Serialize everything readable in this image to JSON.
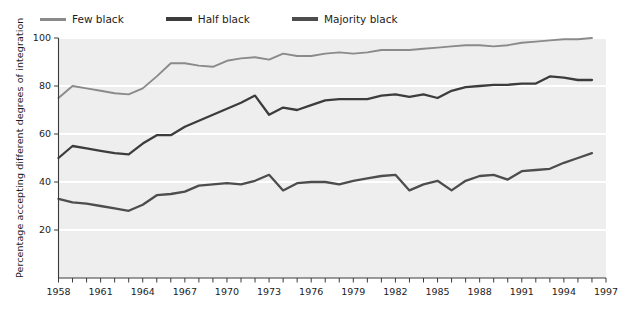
{
  "legend": {
    "position": "top-left",
    "items": [
      {
        "label": "Few black",
        "color": "#8a8a8a",
        "icon": "line-swatch-icon"
      },
      {
        "label": "Half black",
        "color": "#3c3c3c",
        "icon": "line-swatch-icon"
      },
      {
        "label": "Majority black",
        "color": "#4d4d4d",
        "icon": "line-swatch-icon"
      }
    ]
  },
  "axes": {
    "ylabel": "Percentage accepting different degrees of integration",
    "xlabel": "",
    "y_ticks": [
      20,
      40,
      60,
      80,
      100
    ],
    "x_ticks_labeled": [
      1958,
      1961,
      1964,
      1967,
      1970,
      1973,
      1976,
      1979,
      1982,
      1985,
      1988,
      1991,
      1994,
      1997
    ]
  },
  "style": {
    "plot_background": "#eeeeee",
    "grid_color": "#ffffff",
    "axis_color": "#3a3a3a",
    "text_color": "#1c1c1c"
  },
  "chart_data": {
    "type": "line",
    "title": "",
    "xlabel": "",
    "ylabel": "Percentage accepting different degrees of integration",
    "xlim": [
      1958,
      1997
    ],
    "ylim": [
      0,
      100
    ],
    "grid": true,
    "legend_position": "top-left",
    "x": [
      1958,
      1959,
      1960,
      1961,
      1962,
      1963,
      1964,
      1965,
      1966,
      1967,
      1968,
      1969,
      1970,
      1971,
      1972,
      1973,
      1974,
      1975,
      1976,
      1977,
      1978,
      1979,
      1980,
      1981,
      1982,
      1983,
      1984,
      1985,
      1986,
      1987,
      1988,
      1989,
      1990,
      1991,
      1992,
      1993,
      1994,
      1995,
      1996
    ],
    "series": [
      {
        "name": "Few black",
        "color": "#8a8a8a",
        "values": [
          75,
          80,
          79,
          78,
          77,
          76.5,
          79,
          84,
          89.5,
          89.5,
          88.5,
          88,
          90.5,
          91.5,
          92,
          91,
          93.5,
          92.5,
          92.5,
          93.5,
          94,
          93.5,
          94,
          95,
          95,
          95,
          95.5,
          96,
          96.5,
          97,
          97,
          96.5,
          97,
          98,
          98.5,
          99,
          99.5,
          99.5,
          100
        ]
      },
      {
        "name": "Half black",
        "color": "#3c3c3c",
        "values": [
          50,
          55,
          54,
          53,
          52,
          51.5,
          56,
          59.5,
          59.5,
          63,
          65.5,
          68,
          70.5,
          73,
          76,
          68,
          71,
          70,
          72,
          74,
          74.5,
          74.5,
          74.5,
          76,
          76.5,
          75.5,
          76.5,
          75,
          78,
          79.5,
          80,
          80.5,
          80.5,
          81,
          81,
          84,
          83.5,
          82.5,
          82.5
        ]
      },
      {
        "name": "Majority black",
        "color": "#4d4d4d",
        "values": [
          33,
          31.5,
          31,
          30,
          29,
          28,
          30.5,
          34.5,
          35,
          36,
          38.5,
          39,
          39.5,
          39,
          40.5,
          43,
          36.5,
          39.5,
          40,
          40,
          39,
          40.5,
          41.5,
          42.5,
          43,
          36.5,
          39,
          40.5,
          36.5,
          40.5,
          42.5,
          43,
          41,
          44.5,
          45,
          45.5,
          48,
          50,
          52
        ]
      }
    ]
  }
}
